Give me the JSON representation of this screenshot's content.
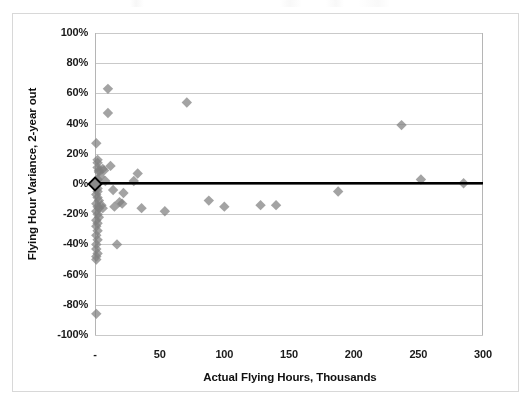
{
  "chart_data": {
    "type": "scatter",
    "title": "",
    "xlabel": "Actual Flying Hours, Thousands",
    "ylabel": "Flying Hour Variance, 2-year out",
    "xlim": [
      0,
      300
    ],
    "ylim": [
      -100,
      100
    ],
    "xticks": [
      0,
      50,
      100,
      150,
      200,
      250,
      300
    ],
    "xticklabels": [
      "-",
      "50",
      "100",
      "150",
      "200",
      "250",
      "300"
    ],
    "yticks": [
      100,
      80,
      60,
      40,
      20,
      0,
      -20,
      -40,
      -60,
      -80,
      -100
    ],
    "yticklabels": [
      "100%",
      "80%",
      "60%",
      "40%",
      "20%",
      "0%",
      "-20%",
      "-40%",
      "-60%",
      "-80%",
      "-100%"
    ],
    "grid": "horizontal",
    "grid_color": "#c9c9c9",
    "marker": "diamond",
    "marker_color": "#808080",
    "marker_size": 8,
    "legend": "none",
    "series": [
      {
        "name": "Flying hour variance",
        "points": [
          [
            1,
            -86
          ],
          [
            1,
            27
          ],
          [
            2,
            16
          ],
          [
            2,
            14
          ],
          [
            2,
            11
          ],
          [
            3,
            9
          ],
          [
            3,
            8
          ],
          [
            4,
            5
          ],
          [
            2,
            3
          ],
          [
            1,
            1
          ],
          [
            1,
            -1
          ],
          [
            2,
            -3
          ],
          [
            2,
            -5
          ],
          [
            1,
            -7
          ],
          [
            2,
            -9
          ],
          [
            3,
            -11
          ],
          [
            1,
            -13
          ],
          [
            2,
            -15
          ],
          [
            3,
            -16
          ],
          [
            1,
            -18
          ],
          [
            2,
            -20
          ],
          [
            3,
            -22
          ],
          [
            1,
            -24
          ],
          [
            2,
            -26
          ],
          [
            1,
            -28
          ],
          [
            2,
            -31
          ],
          [
            1,
            -34
          ],
          [
            2,
            -37
          ],
          [
            1,
            -40
          ],
          [
            1,
            -43
          ],
          [
            2,
            -46
          ],
          [
            1,
            -48
          ],
          [
            1,
            -50
          ],
          [
            6,
            10
          ],
          [
            7,
            9
          ],
          [
            8,
            2
          ],
          [
            5,
            -14
          ],
          [
            6,
            -16
          ],
          [
            10,
            63
          ],
          [
            10,
            47
          ],
          [
            12,
            12
          ],
          [
            14,
            -4
          ],
          [
            15,
            -15
          ],
          [
            17,
            -40
          ],
          [
            19,
            -12
          ],
          [
            21,
            -13
          ],
          [
            22,
            -6
          ],
          [
            30,
            2
          ],
          [
            33,
            7
          ],
          [
            36,
            -16
          ],
          [
            54,
            -18
          ],
          [
            71,
            54
          ],
          [
            88,
            -11
          ],
          [
            100,
            -15
          ],
          [
            128,
            -14
          ],
          [
            140,
            -14
          ],
          [
            188,
            -5
          ],
          [
            237,
            39
          ],
          [
            252,
            3
          ],
          [
            285,
            0.5
          ]
        ]
      }
    ],
    "reference_line": {
      "name": "trend-line",
      "y": 0.5,
      "color": "#000000",
      "width": 2.6,
      "x_start": 0,
      "x_end": 300
    },
    "origin_marker": {
      "x": 0,
      "y": 0,
      "fill": "#8a8a8a",
      "stroke": "#000000",
      "size": 13
    }
  },
  "plot_geometry": {
    "left": 95,
    "top": 33,
    "right": 483,
    "bottom": 335
  }
}
